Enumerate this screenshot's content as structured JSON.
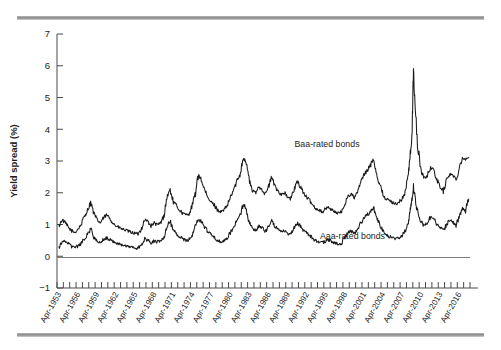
{
  "chart_data": {
    "type": "line",
    "title": "",
    "xlabel": "",
    "ylabel": "Yield spread (%)",
    "ylim": [
      -1,
      7
    ],
    "yticks": [
      -1,
      0,
      1,
      2,
      3,
      4,
      5,
      6,
      7
    ],
    "ytick_labels": [
      "−1",
      "0",
      "1",
      "2",
      "3",
      "4",
      "5",
      "6",
      "7"
    ],
    "grid": false,
    "legend_position": "in-plot annotations",
    "x_start_year": 1953,
    "x_end_year": 2018,
    "xtick_labels": [
      "Apr-1953",
      "Apr-1956",
      "Apr-1959",
      "Apr-1962",
      "Apr-1965",
      "Apr-1968",
      "Apr-1971",
      "Apr-1974",
      "Apr-1977",
      "Apr-1980",
      "Apr-1983",
      "Apr-1986",
      "Apr-1989",
      "Apr-1992",
      "Apr-1995",
      "Apr-1998",
      "Apr-2001",
      "Apr-2004",
      "Apr-2007",
      "Apr-2010",
      "Apr-2013",
      "Apr-2016"
    ],
    "annotations": [
      {
        "text": "Baa-rated bonds",
        "x_year": 1995.5,
        "y": 3.45
      },
      {
        "text": "Aaa-rated bonds",
        "x_year": 1999.5,
        "y": 0.55
      }
    ],
    "series": [
      {
        "name": "Baa-rated bonds",
        "color": "#1a1a1a",
        "x": [
          1953.3,
          1953.8,
          1954.3,
          1954.8,
          1955.3,
          1955.8,
          1956.3,
          1956.8,
          1957.3,
          1957.8,
          1958.3,
          1958.8,
          1959.3,
          1959.8,
          1960.3,
          1960.8,
          1961.3,
          1961.8,
          1962.3,
          1962.8,
          1963.3,
          1963.8,
          1964.3,
          1964.8,
          1965.3,
          1965.8,
          1966.3,
          1966.8,
          1967.3,
          1967.8,
          1968.3,
          1968.8,
          1969.3,
          1969.8,
          1970.3,
          1970.8,
          1971.3,
          1971.8,
          1972.3,
          1972.8,
          1973.3,
          1973.8,
          1974.3,
          1974.8,
          1975.3,
          1975.8,
          1976.3,
          1976.8,
          1977.3,
          1977.8,
          1978.3,
          1978.8,
          1979.3,
          1979.8,
          1980.3,
          1980.8,
          1981.3,
          1981.8,
          1982.3,
          1982.8,
          1983.3,
          1983.8,
          1984.3,
          1984.8,
          1985.3,
          1985.8,
          1986.3,
          1986.8,
          1987.3,
          1987.8,
          1988.3,
          1988.8,
          1989.3,
          1989.8,
          1990.3,
          1990.8,
          1991.3,
          1991.8,
          1992.3,
          1992.8,
          1993.3,
          1993.8,
          1994.3,
          1994.8,
          1995.3,
          1995.8,
          1996.3,
          1996.8,
          1997.3,
          1997.8,
          1998.3,
          1998.8,
          1999.3,
          1999.8,
          2000.3,
          2000.8,
          2001.3,
          2001.8,
          2002.3,
          2002.8,
          2003.3,
          2003.8,
          2004.3,
          2004.8,
          2005.3,
          2005.8,
          2006.3,
          2006.8,
          2007.3,
          2007.8,
          2008.3,
          2008.6,
          2008.9,
          2009.1,
          2009.4,
          2009.8,
          2010.3,
          2010.8,
          2011.3,
          2011.8,
          2012.3,
          2012.8,
          2013.3,
          2013.8,
          2014.3,
          2014.8,
          2015.3,
          2015.8,
          2016.3,
          2016.8,
          2017.3,
          2017.8
        ],
        "y": [
          0.95,
          1.15,
          1.05,
          0.9,
          0.8,
          0.75,
          0.85,
          1.0,
          1.25,
          1.45,
          1.7,
          1.35,
          1.15,
          1.05,
          1.2,
          1.3,
          1.2,
          1.05,
          0.95,
          0.9,
          0.85,
          0.82,
          0.78,
          0.75,
          0.72,
          0.7,
          0.88,
          1.15,
          1.1,
          0.95,
          1.05,
          0.98,
          1.05,
          1.25,
          1.85,
          2.1,
          1.7,
          1.6,
          1.45,
          1.35,
          1.3,
          1.35,
          1.6,
          2.0,
          2.6,
          2.35,
          2.05,
          1.8,
          1.7,
          1.6,
          1.45,
          1.4,
          1.45,
          1.6,
          1.85,
          2.1,
          2.35,
          2.6,
          3.1,
          2.95,
          2.35,
          2.05,
          2.0,
          2.2,
          2.1,
          1.95,
          2.2,
          2.5,
          2.2,
          2.05,
          1.95,
          2.0,
          1.85,
          1.8,
          2.1,
          2.35,
          2.2,
          2.0,
          1.85,
          1.75,
          1.6,
          1.5,
          1.45,
          1.4,
          1.5,
          1.55,
          1.45,
          1.4,
          1.35,
          1.4,
          1.65,
          1.9,
          1.95,
          1.85,
          2.0,
          2.35,
          2.55,
          2.7,
          2.85,
          3.1,
          2.6,
          2.25,
          1.95,
          1.8,
          1.75,
          1.7,
          1.65,
          1.7,
          1.8,
          2.0,
          2.6,
          3.2,
          3.9,
          5.95,
          4.55,
          3.4,
          2.7,
          2.45,
          2.55,
          2.8,
          2.7,
          2.4,
          2.2,
          2.05,
          2.4,
          2.6,
          2.55,
          2.4,
          2.8,
          3.1,
          3.05,
          3.1
        ]
      },
      {
        "name": "Aaa-rated bonds",
        "color": "#1a1a1a",
        "x": [
          1953.3,
          1953.8,
          1954.3,
          1954.8,
          1955.3,
          1955.8,
          1956.3,
          1956.8,
          1957.3,
          1957.8,
          1958.3,
          1958.8,
          1959.3,
          1959.8,
          1960.3,
          1960.8,
          1961.3,
          1961.8,
          1962.3,
          1962.8,
          1963.3,
          1963.8,
          1964.3,
          1964.8,
          1965.3,
          1965.8,
          1966.3,
          1966.8,
          1967.3,
          1967.8,
          1968.3,
          1968.8,
          1969.3,
          1969.8,
          1970.3,
          1970.8,
          1971.3,
          1971.8,
          1972.3,
          1972.8,
          1973.3,
          1973.8,
          1974.3,
          1974.8,
          1975.3,
          1975.8,
          1976.3,
          1976.8,
          1977.3,
          1977.8,
          1978.3,
          1978.8,
          1979.3,
          1979.8,
          1980.3,
          1980.8,
          1981.3,
          1981.8,
          1982.3,
          1982.8,
          1983.3,
          1983.8,
          1984.3,
          1984.8,
          1985.3,
          1985.8,
          1986.3,
          1986.8,
          1987.3,
          1987.8,
          1988.3,
          1988.8,
          1989.3,
          1989.8,
          1990.3,
          1990.8,
          1991.3,
          1991.8,
          1992.3,
          1992.8,
          1993.3,
          1993.8,
          1994.3,
          1994.8,
          1995.3,
          1995.8,
          1996.3,
          1996.8,
          1997.3,
          1997.8,
          1998.3,
          1998.8,
          1999.3,
          1999.8,
          2000.3,
          2000.8,
          2001.3,
          2001.8,
          2002.3,
          2002.8,
          2003.3,
          2003.8,
          2004.3,
          2004.8,
          2005.3,
          2005.8,
          2006.3,
          2006.8,
          2007.3,
          2007.8,
          2008.3,
          2008.6,
          2008.9,
          2009.1,
          2009.4,
          2009.8,
          2010.3,
          2010.8,
          2011.3,
          2011.8,
          2012.3,
          2012.8,
          2013.3,
          2013.8,
          2014.3,
          2014.8,
          2015.3,
          2015.8,
          2016.3,
          2016.8,
          2017.3,
          2017.8
        ],
        "y": [
          0.25,
          0.45,
          0.5,
          0.4,
          0.3,
          0.28,
          0.32,
          0.4,
          0.55,
          0.7,
          0.85,
          0.6,
          0.5,
          0.45,
          0.52,
          0.58,
          0.52,
          0.45,
          0.4,
          0.38,
          0.35,
          0.33,
          0.3,
          0.28,
          0.26,
          0.25,
          0.38,
          0.55,
          0.5,
          0.42,
          0.48,
          0.45,
          0.5,
          0.6,
          0.95,
          1.1,
          0.8,
          0.72,
          0.62,
          0.55,
          0.5,
          0.52,
          0.68,
          0.95,
          1.2,
          1.05,
          0.9,
          0.75,
          0.68,
          0.6,
          0.5,
          0.45,
          0.48,
          0.58,
          0.75,
          0.95,
          1.1,
          1.25,
          1.65,
          1.5,
          1.05,
          0.85,
          0.82,
          0.95,
          0.88,
          0.78,
          0.95,
          1.15,
          0.95,
          0.85,
          0.78,
          0.8,
          0.7,
          0.68,
          0.88,
          1.05,
          0.95,
          0.82,
          0.72,
          0.65,
          0.55,
          0.48,
          0.45,
          0.42,
          0.48,
          0.52,
          0.45,
          0.42,
          0.38,
          0.42,
          0.58,
          0.75,
          0.8,
          0.72,
          0.85,
          1.05,
          1.2,
          1.3,
          1.4,
          1.55,
          1.2,
          1.0,
          0.8,
          0.68,
          0.62,
          0.58,
          0.55,
          0.58,
          0.65,
          0.8,
          1.1,
          1.45,
          1.85,
          2.2,
          1.75,
          1.35,
          1.1,
          0.95,
          1.05,
          1.25,
          1.2,
          1.0,
          0.9,
          0.8,
          1.0,
          1.15,
          1.1,
          0.95,
          1.25,
          1.5,
          1.45,
          1.8
        ]
      }
    ]
  }
}
